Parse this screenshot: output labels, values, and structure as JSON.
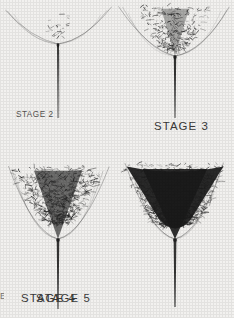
{
  "plate": {
    "title": "Growth stages plate",
    "background_color": "#f2f1ef",
    "ink_color": "#1a1a1a",
    "caption_color": "#3a3a3a",
    "rows": 2,
    "columns": 2
  },
  "panels": [
    {
      "id": "stage-2",
      "label": "STAGE 2",
      "row": 0,
      "column": 0,
      "canopy_density": 0.18,
      "canopy_width": 46,
      "canopy_height": 30,
      "canopy_shape": "narrow spike cluster",
      "stem_length": 74,
      "stem_top_width": 2.0,
      "stem_bottom_width": 0.7,
      "arc_span": 104,
      "arc_lift": 26,
      "tuft_count": 120,
      "center_x": 58,
      "canopy_center_y": 22,
      "node_y": 44
    },
    {
      "id": "stage-3",
      "label": "STAGE 3",
      "row": 0,
      "column": 1,
      "canopy_density": 0.52,
      "canopy_width": 82,
      "canopy_height": 46,
      "canopy_shape": "open V funnel",
      "stem_length": 62,
      "stem_top_width": 2.4,
      "stem_bottom_width": 0.9,
      "arc_span": 108,
      "arc_lift": 30,
      "tuft_count": 520,
      "center_x": 58,
      "canopy_center_y": 28,
      "node_y": 56
    },
    {
      "id": "stage-4",
      "label": "STAGE 4",
      "row": 1,
      "column": 0,
      "canopy_density": 0.8,
      "canopy_width": 96,
      "canopy_height": 58,
      "canopy_shape": "broad inverted triangle",
      "stem_length": 70,
      "stem_top_width": 2.6,
      "stem_bottom_width": 1.0,
      "arc_span": 98,
      "arc_lift": 34,
      "tuft_count": 900,
      "center_x": 58,
      "canopy_center_y": 36,
      "node_y": 80
    },
    {
      "id": "stage-5",
      "label": "STAGE 5",
      "row": 1,
      "column": 1,
      "canopy_density": 0.96,
      "canopy_width": 104,
      "canopy_height": 62,
      "canopy_shape": "solid filled triangle",
      "stem_length": 68,
      "stem_top_width": 2.8,
      "stem_bottom_width": 1.1,
      "arc_span": 96,
      "arc_lift": 30,
      "tuft_count": 1200,
      "center_x": 58,
      "canopy_center_y": 36,
      "node_y": 80
    }
  ],
  "edge_artifact": {
    "text": "E",
    "note": "partial clipped character at left margin"
  }
}
